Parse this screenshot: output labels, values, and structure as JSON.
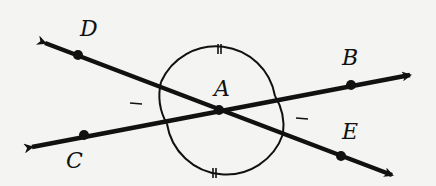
{
  "diagram": {
    "center_point": {
      "label": "A",
      "x": 219,
      "y": 110
    },
    "points": [
      {
        "label": "D",
        "x": 78,
        "y": 55,
        "label_x": 80,
        "label_y": 18
      },
      {
        "label": "B",
        "x": 351,
        "y": 85,
        "label_x": 342,
        "label_y": 47
      },
      {
        "label": "C",
        "x": 84,
        "y": 135,
        "label_x": 66,
        "label_y": 150
      },
      {
        "label": "E",
        "x": 341,
        "y": 156,
        "label_x": 342,
        "label_y": 121
      }
    ],
    "center_label": {
      "text": "A",
      "x": 214,
      "y": 78
    },
    "lines": [
      {
        "name": "line DE",
        "from": [
          37,
          40
        ],
        "to": [
          400,
          178
        ]
      },
      {
        "name": "line CB",
        "from": [
          25,
          148
        ],
        "to": [
          418,
          73
        ]
      }
    ],
    "arc_marks": {
      "top_bottom": "double tick (congruent)",
      "left_right": "single tick (congruent)"
    },
    "colors": {
      "ink": "#111111",
      "background": "#f4f4f2"
    }
  }
}
